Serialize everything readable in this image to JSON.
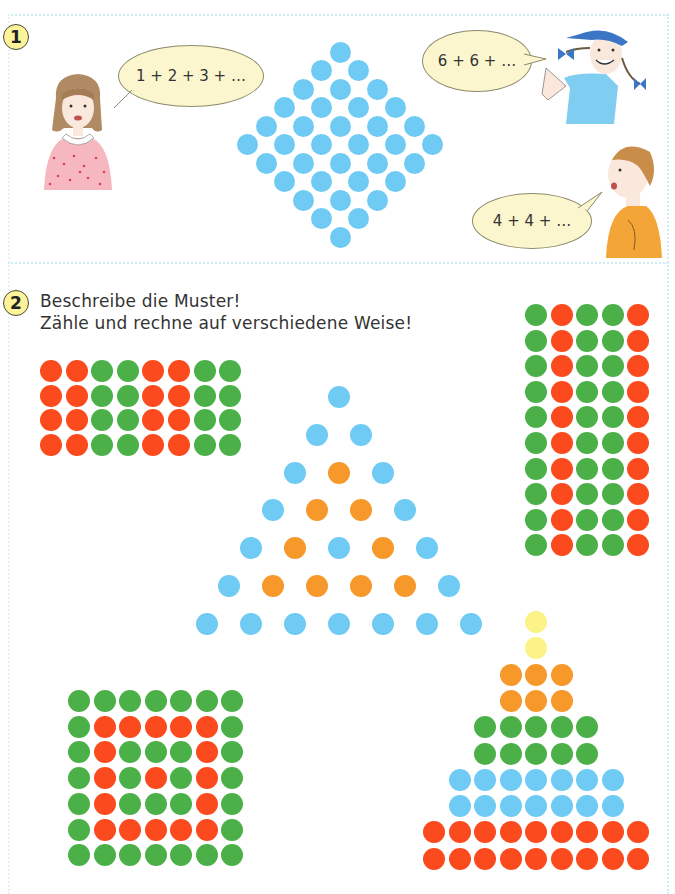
{
  "exercise1": {
    "number": "1",
    "bubbles": {
      "girl_left": "1 + 2 + 3 + …",
      "girl_cap": "6 + 6 + …",
      "boy": "4 + 4 + …"
    },
    "diamond": {
      "color": "#6fcbf3",
      "row_counts": [
        1,
        2,
        3,
        4,
        5,
        6,
        5,
        4,
        3,
        2,
        1
      ],
      "total": 36
    }
  },
  "exercise2": {
    "number": "2",
    "instructions": [
      "Beschreibe die Muster!",
      "Zähle und rechne auf verschiedene Weise!"
    ],
    "colors": {
      "R": "#fb4a1d",
      "G": "#4bb047",
      "B": "#6fcbf3",
      "O": "#f7982a",
      "Y": "#fbf386"
    },
    "patterns": {
      "grid_4x8": [
        "RRGGRRGG",
        "RRGGRRGG",
        "RRGGRRGG",
        "RRGGRRGG"
      ],
      "grid_10x5": [
        "GRGGR",
        "GRGGR",
        "GRGGR",
        "GRGGR",
        "GRGGR",
        "GRGGR",
        "GRGGR",
        "GRGGR",
        "GRGGR",
        "GRGGR"
      ],
      "triangle": [
        "B",
        "BB",
        "BOB",
        "BOOB",
        "BOBOB",
        "BOOOOB",
        "BBBBBBB"
      ],
      "square_7x7": [
        "GGGGGGG",
        "GRRRRRG",
        "GRGGGRG",
        "GRGRGRG",
        "GRGGGRG",
        "GRRRRRG",
        "GGGGGGG"
      ],
      "pyramid": [
        "Y",
        "Y",
        "OOO",
        "OOO",
        "GGGGG",
        "GGGGG",
        "BBBBBBB",
        "BBBBBBB",
        "RRRRRRRRR",
        "RRRRRRRRR"
      ]
    }
  }
}
